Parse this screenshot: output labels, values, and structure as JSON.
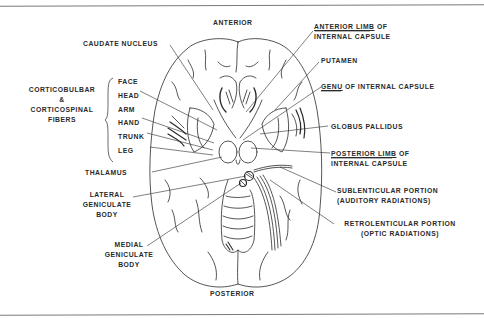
{
  "diagram": {
    "orientation": {
      "top": "ANTERIOR",
      "bottom": "POSTERIOR"
    },
    "left_labels": {
      "caudate_nucleus": "CAUDATE NUCLEUS",
      "fibers_group": {
        "line1": "CORTICOBULBAR",
        "line2": "&",
        "line3": "CORTICOSPINAL",
        "line4": "FIBERS"
      },
      "somatotopy": [
        "FACE",
        "HEAD",
        "ARM",
        "HAND",
        "TRUNK",
        "LEG"
      ],
      "thalamus": "THALAMUS",
      "lateral_geniculate": {
        "line1": "LATERAL",
        "line2": "GENICULATE",
        "line3": "BODY"
      },
      "medial_geniculate": {
        "line1": "MEDIAL",
        "line2": "GENICULATE",
        "line3": "BODY"
      }
    },
    "right_labels": {
      "anterior_limb": {
        "underlined": "ANTERIOR LIMB",
        "rest": " OF",
        "line2": "INTERNAL CAPSULE"
      },
      "putamen": "PUTAMEN",
      "genu": {
        "underlined": "GENU",
        "rest": " OF INTERNAL CAPSULE"
      },
      "globus_pallidus": "GLOBUS PALLIDUS",
      "posterior_limb": {
        "underlined": "POSTERIOR LIMB",
        "rest": " OF",
        "line2": "INTERNAL CAPSULE"
      },
      "sublenticular": {
        "line1": "SUBLENTICULAR PORTION",
        "line2": "(AUDITORY RADIATIONS)"
      },
      "retrolenticular": {
        "line1": "RETROLENTICULAR PORTION",
        "line2": "(OPTIC RADIATIONS)"
      }
    },
    "colors": {
      "ink": "#2a2a2a",
      "rule": "#7a7a7a",
      "background": "#ffffff"
    }
  }
}
